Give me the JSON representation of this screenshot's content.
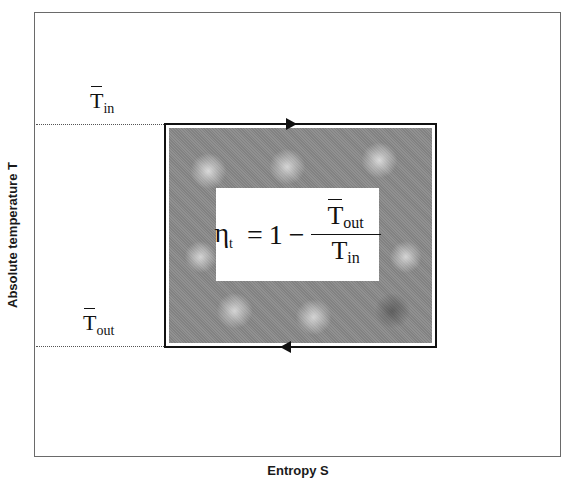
{
  "diagram": {
    "type": "temperature-entropy cycle diagram",
    "y_axis_label": "Absolute temperature T",
    "x_axis_label": "Entropy S",
    "upper_level": {
      "symbol": "T",
      "subscript": "in",
      "description": "mean inlet temperature (overbar)"
    },
    "lower_level": {
      "symbol": "T",
      "subscript": "out",
      "description": "mean outlet temperature (overbar)"
    },
    "cycle": {
      "shape": "rectangle",
      "direction": "clockwise",
      "top_arrow": "right",
      "bottom_arrow": "left",
      "fill": "shaded texture"
    },
    "formula": {
      "lhs_symbol": "η",
      "lhs_subscript": "t",
      "equals": "=",
      "one": "1",
      "minus": "−",
      "numerator_symbol": "T",
      "numerator_subscript": "out",
      "denominator_symbol": "T",
      "denominator_subscript": "in"
    }
  }
}
